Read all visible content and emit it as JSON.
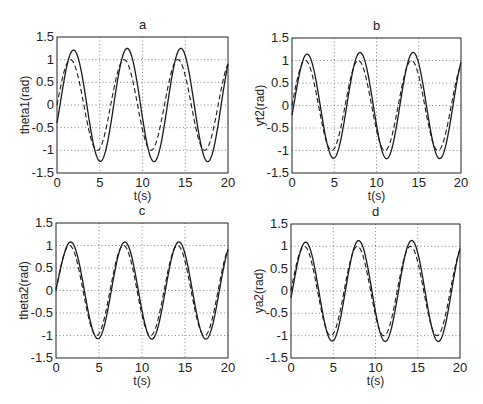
{
  "chart_data": [
    {
      "type": "line",
      "title": "a",
      "xlabel": "t(s)",
      "ylabel": "theta1(rad)",
      "xlim": [
        0,
        20
      ],
      "ylim": [
        -1.5,
        1.5
      ],
      "xticks": [
        0,
        5,
        10,
        15,
        20
      ],
      "yticks": [
        -1.5,
        -1,
        -0.5,
        0,
        0.5,
        1,
        1.5
      ],
      "grid": true,
      "series": [
        {
          "name": "actual",
          "style": "solid",
          "amplitude": 1.25,
          "phase_lag": 0.35,
          "note": "peaks ~1.15 at t≈2, ~1.25 at t≈8.1 and t≈14.4; troughs ~-1.27 at t≈5, 11.3, 17.6"
        },
        {
          "name": "reference",
          "style": "dashed",
          "amplitude": 1.0,
          "phase_lag": 0.0,
          "note": "sin(t): peaks 1 at t≈1.6, 7.9, 14.1; troughs -1 at t≈4.7, 11.0, 17.3"
        }
      ]
    },
    {
      "type": "line",
      "title": "b",
      "xlabel": "t(s)",
      "ylabel": "yt2(rad)",
      "xlim": [
        0,
        20
      ],
      "ylim": [
        -1.5,
        1.5
      ],
      "xticks": [
        0,
        5,
        10,
        15,
        20
      ],
      "yticks": [
        -1.5,
        -1,
        -0.5,
        0,
        0.5,
        1,
        1.5
      ],
      "grid": true,
      "series": [
        {
          "name": "actual",
          "style": "solid",
          "amplitude": 1.18,
          "phase_lag": 0.2,
          "note": "peaks ~1.1 at t≈1.9, ~1.18 at t≈8, 14.3; troughs ~-1.2"
        },
        {
          "name": "reference",
          "style": "dashed",
          "amplitude": 1.0,
          "phase_lag": 0.0
        }
      ]
    },
    {
      "type": "line",
      "title": "c",
      "xlabel": "t(s)",
      "ylabel": "theta2(rad)",
      "xlim": [
        0,
        20
      ],
      "ylim": [
        -1.5,
        1.5
      ],
      "xticks": [
        0,
        5,
        10,
        15,
        20
      ],
      "yticks": [
        -1.5,
        -1,
        -0.5,
        0,
        0.5,
        1,
        1.5
      ],
      "grid": true,
      "series": [
        {
          "name": "actual",
          "style": "solid",
          "amplitude": 1.08,
          "phase_lag": 0.15,
          "note": "starts ~0.2 at t=0; peaks ~1.0-1.07; troughs ~-1.1"
        },
        {
          "name": "reference",
          "style": "dashed",
          "amplitude": 1.0,
          "phase_lag": 0.0
        }
      ]
    },
    {
      "type": "line",
      "title": "d",
      "xlabel": "t(s)",
      "ylabel": "ya2(rad)",
      "xlim": [
        0,
        20
      ],
      "ylim": [
        -1.5,
        1.5
      ],
      "xticks": [
        0,
        5,
        10,
        15,
        20
      ],
      "yticks": [
        -1.5,
        -1,
        -0.5,
        0,
        0.5,
        1,
        1.5
      ],
      "grid": true,
      "series": [
        {
          "name": "actual",
          "style": "solid",
          "amplitude": 1.13,
          "phase_lag": 0.15,
          "note": "peaks ~1.05 at t≈1.8, ~1.13 at t≈8, 14.3; troughs ~-1.15"
        },
        {
          "name": "reference",
          "style": "dashed",
          "amplitude": 1.0,
          "phase_lag": 0.0
        }
      ]
    }
  ],
  "panels": [
    {
      "title": "a",
      "ylabel": "theta1(rad)",
      "xlabel": "t(s)",
      "box": [
        57,
        37,
        228,
        173
      ]
    },
    {
      "title": "b",
      "ylabel": "yt2(rad)",
      "xlabel": "t(s)",
      "box": [
        292,
        38,
        461,
        173
      ]
    },
    {
      "title": "c",
      "ylabel": "theta2(rad)",
      "xlabel": "t(s)",
      "box": [
        56,
        223,
        228,
        358
      ]
    },
    {
      "title": "d",
      "ylabel": "ya2(rad)",
      "xlabel": "t(s)",
      "box": [
        291,
        224,
        460,
        358
      ]
    }
  ],
  "xtick_labels": [
    "0",
    "5",
    "10",
    "15",
    "20"
  ],
  "ytick_labels": [
    "-1.5",
    "-1",
    "-0.5",
    "0",
    "0.5",
    "1",
    "1.5"
  ]
}
